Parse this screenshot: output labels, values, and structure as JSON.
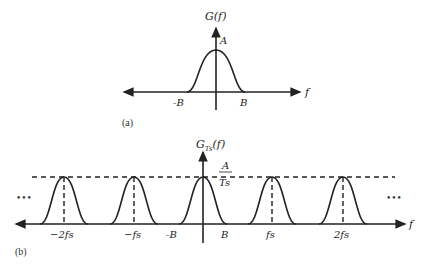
{
  "figure_a": {
    "caption": "(a)",
    "y_label": "G(f)",
    "x_label": "f",
    "peak_label": "A",
    "ticks": [
      "-B",
      "B"
    ]
  },
  "figure_b": {
    "caption": "(b)",
    "y_label_main": "G",
    "y_label_sub": "Ts",
    "y_label_tail": "(f)",
    "x_label": "f",
    "peak_label_num": "A",
    "peak_label_den": "Ts",
    "ticks": [
      "−2fs",
      "−fs",
      "-B",
      "B",
      "fs",
      "2fs"
    ],
    "ellipsis_left": "•••",
    "ellipsis_right": "•••"
  },
  "colors": {
    "stroke": "#222222",
    "background": "#ffffff"
  }
}
